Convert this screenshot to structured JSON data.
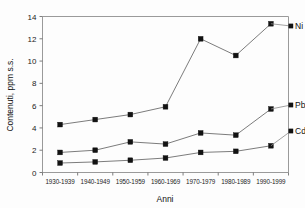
{
  "chart_data": {
    "type": "line",
    "title": "",
    "subtitle": "",
    "xlabel": "Anni",
    "ylabel": "Contenuti, ppm s.s.",
    "categories": [
      "1930-1939",
      "1940-1949",
      "1950-1959",
      "1960-1969",
      "1970-1979",
      "1980-1989",
      "1990-1999"
    ],
    "ylim": [
      0,
      14
    ],
    "yticks": [
      0,
      2,
      4,
      6,
      8,
      10,
      12,
      14
    ],
    "grid": false,
    "legend_position": "right-inline-labels",
    "series": [
      {
        "name": "Ni",
        "values": [
          4.3,
          4.75,
          5.2,
          5.9,
          12.0,
          10.5,
          13.35
        ]
      },
      {
        "name": "Pb",
        "values": [
          1.8,
          2.0,
          2.75,
          2.55,
          3.55,
          3.35,
          5.7
        ]
      },
      {
        "name": "Cd",
        "values": [
          0.85,
          0.95,
          1.1,
          1.3,
          1.8,
          1.9,
          2.4
        ]
      }
    ],
    "colors": {
      "marker": "#121212",
      "line": "#6d6d6d",
      "axis": "#9a9a9a",
      "text": "#111111",
      "background": "#fdfdfd"
    }
  }
}
